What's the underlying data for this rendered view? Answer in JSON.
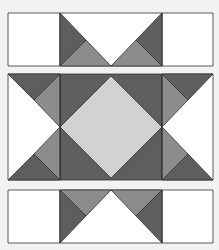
{
  "figure": {
    "colors": {
      "background": "#f2f2f2",
      "white": "#ffffff",
      "dark": "#5e5e5e",
      "medium": "#8c8c8c",
      "light": "#d2d2d2",
      "stroke": "#333333"
    },
    "rows": [
      {
        "name": "top-strip",
        "y": 13,
        "height": 53
      },
      {
        "name": "center-block",
        "y": 74,
        "height": 106
      },
      {
        "name": "bottom-strip",
        "y": 190,
        "height": 53
      }
    ]
  }
}
